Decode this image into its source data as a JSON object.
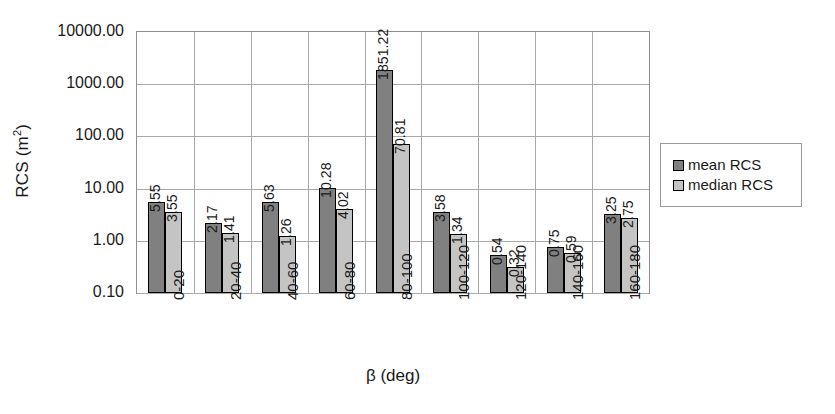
{
  "chart_data": {
    "type": "bar",
    "title": "",
    "xlabel": "β (deg)",
    "ylabel": "RCS (m²)",
    "ylabel_base": "RCS (m",
    "ylabel_sup": "2",
    "ylabel_tail": ")",
    "yscale": "log",
    "ylim": [
      0.1,
      10000
    ],
    "grid": true,
    "legend_position": "right",
    "categories": [
      "0-20",
      "20-40",
      "40-60",
      "60-80",
      "80-100",
      "100-120",
      "120-140",
      "140-160",
      "160-180"
    ],
    "y_ticks": [
      "0.10",
      "1.00",
      "10.00",
      "100.00",
      "1000.00",
      "10000.00"
    ],
    "y_tick_values": [
      0.1,
      1,
      10,
      100,
      1000,
      10000
    ],
    "series": [
      {
        "name": "mean RCS",
        "color": "#808080",
        "values": [
          5.55,
          2.17,
          5.63,
          10.28,
          1851.22,
          3.58,
          0.54,
          0.75,
          3.25
        ],
        "labels": [
          "5.55",
          "2.17",
          "5.63",
          "10.28",
          "1851.22",
          "3.58",
          "0.54",
          "0.75",
          "3.25"
        ]
      },
      {
        "name": "median RCS",
        "color": "#c4c4c4",
        "values": [
          3.55,
          1.41,
          1.26,
          4.02,
          70.81,
          1.34,
          0.32,
          0.59,
          2.75
        ],
        "labels": [
          "3.55",
          "1.41",
          "1.26",
          "4.02",
          "70.81",
          "1.34",
          "0.32",
          "0.59",
          "2.75"
        ]
      }
    ]
  },
  "legend": {
    "items": [
      {
        "label": "mean RCS",
        "swatch": "mean"
      },
      {
        "label": "median RCS",
        "swatch": "median"
      }
    ]
  }
}
